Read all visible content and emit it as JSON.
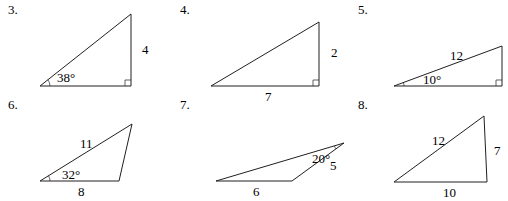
{
  "problems": [
    {
      "number": "3.",
      "vertices": [
        [
          40,
          86
        ],
        [
          131,
          86
        ],
        [
          131,
          14
        ]
      ],
      "right_angle": true,
      "labels": [
        {
          "text": "4",
          "x": 142,
          "y": 54,
          "role": "side-right"
        },
        {
          "text": "38°",
          "x": 57,
          "y": 82,
          "role": "angle-left"
        }
      ]
    },
    {
      "number": "4.",
      "vertices": [
        [
          211,
          86
        ],
        [
          319,
          86
        ],
        [
          319,
          22
        ]
      ],
      "right_angle": true,
      "labels": [
        {
          "text": "2",
          "x": 331,
          "y": 57,
          "role": "side-right"
        },
        {
          "text": "7",
          "x": 265,
          "y": 101,
          "role": "side-bottom"
        }
      ]
    },
    {
      "number": "5.",
      "vertices": [
        [
          394,
          86
        ],
        [
          502,
          86
        ],
        [
          502,
          46
        ]
      ],
      "right_angle": true,
      "labels": [
        {
          "text": "12",
          "x": 450,
          "y": 60,
          "role": "hypotenuse"
        },
        {
          "text": "10°",
          "x": 423,
          "y": 84,
          "role": "angle-left"
        }
      ]
    },
    {
      "number": "6.",
      "vertices": [
        [
          40,
          181
        ],
        [
          119,
          181
        ],
        [
          132,
          124
        ]
      ],
      "right_angle": false,
      "labels": [
        {
          "text": "11",
          "x": 80,
          "y": 148,
          "role": "side-top"
        },
        {
          "text": "32°",
          "x": 62,
          "y": 179,
          "role": "angle-left"
        },
        {
          "text": "8",
          "x": 78,
          "y": 196,
          "role": "side-bottom"
        }
      ]
    },
    {
      "number": "7.",
      "vertices": [
        [
          216,
          181
        ],
        [
          292,
          181
        ],
        [
          344,
          143
        ]
      ],
      "right_angle": false,
      "labels": [
        {
          "text": "20°",
          "x": 312,
          "y": 163,
          "role": "angle-top"
        },
        {
          "text": "5",
          "x": 330,
          "y": 170,
          "role": "side-right"
        },
        {
          "text": "6",
          "x": 253,
          "y": 196,
          "role": "side-bottom"
        }
      ]
    },
    {
      "number": "8.",
      "vertices": [
        [
          394,
          182
        ],
        [
          487,
          182
        ],
        [
          484,
          116
        ]
      ],
      "right_angle": false,
      "labels": [
        {
          "text": "12",
          "x": 432,
          "y": 145,
          "role": "side-left"
        },
        {
          "text": "7",
          "x": 494,
          "y": 155,
          "role": "side-right"
        },
        {
          "text": "10",
          "x": 443,
          "y": 197,
          "role": "side-bottom"
        }
      ]
    }
  ],
  "numbers_pos": [
    [
      8,
      14
    ],
    [
      180,
      14
    ],
    [
      358,
      14
    ],
    [
      8,
      109
    ],
    [
      180,
      109
    ],
    [
      358,
      109
    ]
  ]
}
